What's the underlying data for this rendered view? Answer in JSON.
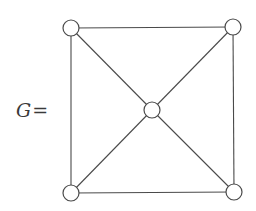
{
  "figure": {
    "label": {
      "variable": "G",
      "operator": "="
    },
    "colors": {
      "line": "#4a4a4a",
      "node_fill": "#ffffff",
      "background": "#ffffff"
    },
    "node_radius": 8,
    "nodes": [
      {
        "id": "top-left",
        "x": 71,
        "y": 28
      },
      {
        "id": "top-right",
        "x": 233,
        "y": 27
      },
      {
        "id": "center",
        "x": 152,
        "y": 110
      },
      {
        "id": "bottom-left",
        "x": 71,
        "y": 193
      },
      {
        "id": "bottom-right",
        "x": 234,
        "y": 192
      }
    ],
    "edges": [
      [
        "top-left",
        "top-right"
      ],
      [
        "top-left",
        "bottom-left"
      ],
      [
        "top-right",
        "bottom-right"
      ],
      [
        "bottom-left",
        "bottom-right"
      ],
      [
        "top-left",
        "center"
      ],
      [
        "top-right",
        "center"
      ],
      [
        "bottom-left",
        "center"
      ],
      [
        "bottom-right",
        "center"
      ]
    ]
  }
}
